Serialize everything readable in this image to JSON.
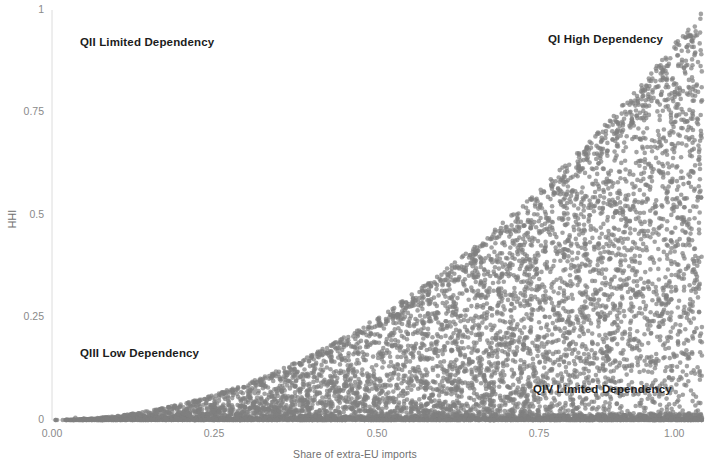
{
  "chart_data": {
    "type": "scatter",
    "title": "",
    "xlabel": "Share of extra-EU imports",
    "ylabel": "HHI",
    "xlim": [
      0.0,
      1.0
    ],
    "ylim": [
      0.0,
      1.0
    ],
    "xticks": [
      "0.00",
      "0.25",
      "0.50",
      "0.75",
      "1.00"
    ],
    "xtick_values": [
      0.0,
      0.25,
      0.5,
      0.75,
      1.0
    ],
    "yticks": [
      "0",
      "0.25",
      "0.5",
      "0.75",
      "1"
    ],
    "ytick_values": [
      0.0,
      0.25,
      0.5,
      0.75,
      1.0
    ],
    "grid": false,
    "legend": "none",
    "marker_color": "#808080",
    "marker_size": 4.6,
    "marker_opacity": 0.72,
    "point_count": 6000,
    "distribution_note": "Dense wedge-shaped cloud bounded above by HHI = x^2 envelope and below by HHI = 0; density highest near the x-axis and increasing toward x = 1.",
    "annotations": [
      {
        "text": "QII Limited Dependency",
        "x": 0.13,
        "y": 0.905,
        "quadrant": "QII"
      },
      {
        "text": "QI High Dependency",
        "x": 0.79,
        "y": 0.915,
        "quadrant": "QI"
      },
      {
        "text": "QIII Low Dependency",
        "x": 0.13,
        "y": 0.155,
        "quadrant": "QIII"
      },
      {
        "text": "QIV Limited Dependency",
        "x": 0.78,
        "y": 0.075,
        "quadrant": "QIV"
      }
    ],
    "axis_line_color": "#d9d9d9"
  }
}
